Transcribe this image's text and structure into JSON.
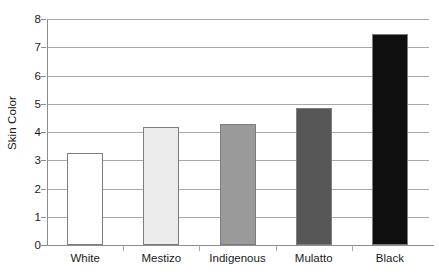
{
  "chart_data": {
    "type": "bar",
    "title": "",
    "xlabel": "",
    "ylabel": "Skin Color",
    "categories": [
      "White",
      "Mestizo",
      "Indigenous",
      "Mulatto",
      "Black"
    ],
    "values": [
      3.27,
      4.17,
      4.28,
      4.86,
      7.48
    ],
    "bar_colors": [
      "#ffffff",
      "#ebebeb",
      "#9a9a9a",
      "#575757",
      "#100f0f"
    ],
    "bar_border_color": "#7d7d7d",
    "ylim": [
      0,
      8
    ],
    "yticks": [
      0,
      1,
      2,
      3,
      4,
      5,
      6,
      7,
      8
    ],
    "ytick_labels": [
      "0",
      "1",
      "2",
      "3",
      "4",
      "5",
      "6",
      "7",
      "8"
    ],
    "grid": "horizontal",
    "legend": "none",
    "gridline_color": "#a9a9a9",
    "axis_color": "#8d8d8d",
    "text_color": "#1a1a1a"
  }
}
